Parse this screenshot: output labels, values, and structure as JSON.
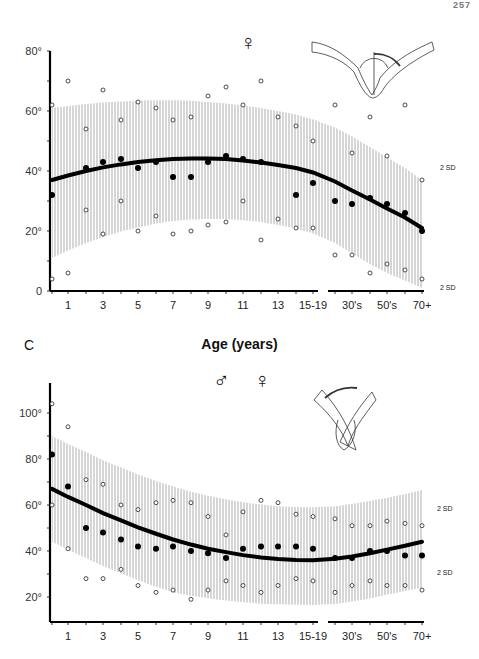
{
  "page_header": {
    "running_title": "",
    "page_number": "257"
  },
  "panel_label": "C",
  "x_axis_title": "Age (years)",
  "sd_label": "2 SD",
  "charts_meta": [
    {
      "sex_symbols": [
        "♀"
      ]
    },
    {
      "sex_symbols": [
        "♂",
        "♀"
      ]
    }
  ],
  "chart_data": [
    {
      "type": "scatter",
      "title": "Female range of motion by age",
      "sex": "female",
      "xlabel": "Age (years)",
      "ylabel": "Degrees",
      "ylim": [
        0,
        80
      ],
      "y_ticks": [
        "0",
        "20°",
        "40°",
        "60°",
        "80°"
      ],
      "x_tick_labels": [
        "1",
        "3",
        "5",
        "7",
        "9",
        "11",
        "13",
        "15-19",
        "30's",
        "50's",
        "70+"
      ],
      "categories": [
        "0",
        "1",
        "2",
        "3",
        "4",
        "5",
        "6",
        "7",
        "8",
        "9",
        "10",
        "11",
        "12",
        "13",
        "14",
        "15-19",
        "20's",
        "30's",
        "40's",
        "50's",
        "60's",
        "70+"
      ],
      "grid": false,
      "series": [
        {
          "name": "Mean (filled)",
          "marker": "filled-circle",
          "values": [
            32,
            null,
            41,
            43,
            44,
            41,
            43,
            38,
            38,
            43,
            45,
            44,
            43,
            null,
            32,
            36,
            30,
            29,
            31,
            29,
            26,
            20
          ]
        },
        {
          "name": "+2 SD observed (open)",
          "marker": "open-circle",
          "values": [
            62,
            70,
            54,
            67,
            57,
            63,
            61,
            57,
            58,
            65,
            68,
            62,
            70,
            58,
            55,
            50,
            62,
            46,
            58,
            45,
            62,
            37
          ]
        },
        {
          "name": "-2 SD observed (open)",
          "marker": "open-circle",
          "values": [
            4,
            6,
            27,
            19,
            30,
            20,
            25,
            19,
            20,
            22,
            23,
            30,
            17,
            24,
            21,
            21,
            12,
            12,
            6,
            9,
            7,
            4
          ]
        },
        {
          "name": "Fitted mean curve",
          "marker": "line",
          "values": [
            37,
            38.5,
            40,
            41.2,
            42.2,
            43,
            43.6,
            44,
            44.2,
            44.2,
            44,
            43.5,
            42.8,
            42,
            41,
            39.5,
            36.5,
            33.5,
            30.5,
            27.5,
            24.5,
            21
          ]
        },
        {
          "name": "Upper band (+2 SD)",
          "marker": "band",
          "values": [
            61,
            61.7,
            62.3,
            62.8,
            63.2,
            63.5,
            63.6,
            63.6,
            63.4,
            63,
            62.5,
            61.8,
            61,
            60,
            58.8,
            57.2,
            54.5,
            51.5,
            48,
            44.5,
            41,
            37
          ]
        },
        {
          "name": "Lower band (-2 SD)",
          "marker": "band",
          "values": [
            11,
            13.5,
            16,
            18,
            19.8,
            21.2,
            22.5,
            23.3,
            23.8,
            24,
            24,
            23.6,
            23,
            22,
            20.8,
            19.2,
            16,
            12.5,
            9,
            6,
            3.5,
            1
          ]
        }
      ],
      "annotations": [
        "2 SD (upper)",
        "2 SD (lower)"
      ]
    },
    {
      "type": "scatter",
      "title": "Male and female range of motion by age",
      "sex": "male and female",
      "xlabel": "Age (years)",
      "ylabel": "Degrees",
      "ylim": [
        10,
        110
      ],
      "y_ticks": [
        "20°",
        "40°",
        "60°",
        "80°",
        "100°"
      ],
      "x_tick_labels": [
        "1",
        "3",
        "5",
        "7",
        "9",
        "11",
        "13",
        "15-19",
        "30's",
        "50's",
        "70+"
      ],
      "categories": [
        "0",
        "1",
        "2",
        "3",
        "4",
        "5",
        "6",
        "7",
        "8",
        "9",
        "10",
        "11",
        "12",
        "13",
        "14",
        "15-19",
        "20's",
        "30's",
        "40's",
        "50's",
        "60's",
        "70+"
      ],
      "grid": false,
      "series": [
        {
          "name": "Mean (filled)",
          "marker": "filled-circle",
          "values": [
            82,
            68,
            50,
            48,
            45,
            42,
            41,
            42,
            40,
            39,
            37,
            41,
            42,
            42,
            42,
            41,
            37,
            37,
            40,
            40,
            38,
            38
          ]
        },
        {
          "name": "+2 SD observed (open)",
          "marker": "open-circle",
          "values": [
            104,
            94,
            71,
            69,
            60,
            58,
            61,
            62,
            61,
            55,
            47,
            57,
            62,
            61,
            56,
            55,
            54,
            51,
            51,
            53,
            52,
            51
          ]
        },
        {
          "name": "-2 SD observed (open)",
          "marker": "open-circle",
          "values": [
            60,
            41,
            28,
            28,
            32,
            25,
            22,
            23,
            19,
            23,
            27,
            25,
            22,
            25,
            28,
            27,
            22,
            25,
            27,
            25,
            25,
            23
          ]
        },
        {
          "name": "Fitted mean curve",
          "marker": "line",
          "values": [
            67,
            63.5,
            60,
            56.5,
            53.3,
            50.3,
            47.5,
            45,
            42.8,
            41,
            39.5,
            38.2,
            37.2,
            36.5,
            36.1,
            36,
            36.6,
            37.6,
            39,
            40.6,
            42.3,
            44
          ]
        },
        {
          "name": "Upper band (+2 SD)",
          "marker": "band",
          "values": [
            90,
            86.5,
            83,
            79.5,
            76.3,
            73.3,
            70.5,
            68,
            65.8,
            64,
            62.5,
            61.2,
            60.2,
            59.5,
            59.1,
            59,
            59.5,
            60.4,
            61.7,
            63.2,
            64.8,
            66.5
          ]
        },
        {
          "name": "Lower band (-2 SD)",
          "marker": "band",
          "values": [
            44,
            40.5,
            37,
            33.5,
            30.3,
            27.3,
            24.5,
            22,
            20.5,
            19.5,
            18.5,
            17.7,
            17.1,
            16.8,
            16.6,
            16.5,
            17,
            18,
            19.4,
            21,
            22.6,
            24
          ]
        }
      ],
      "annotations": [
        "2 SD (upper)",
        "2 SD (lower)"
      ]
    }
  ]
}
